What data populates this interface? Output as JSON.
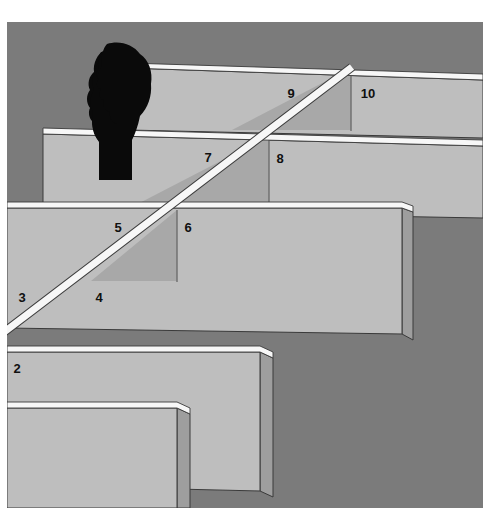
{
  "image": {
    "title": "Maze of walls in perspective with numbered compartments",
    "kind": "grayscale-illustration",
    "width": 483,
    "height": 528,
    "margins": {
      "top": 22,
      "left": 7,
      "right": 0,
      "bottom": 20
    }
  },
  "colors": {
    "background_gray": "#7b7b7b",
    "wall_face_light": "#bebebe",
    "wall_face_shaded": "#a8a8a8",
    "wall_top_highlight": "#f7f7f7",
    "wall_edge_dark": "#8d8d8d",
    "outline": "#3a3a3a",
    "silhouette": "#0a0a0a",
    "page_white": "#ffffff",
    "number_text": "#101010"
  },
  "labels": [
    {
      "id": "2",
      "text": "2",
      "x": 17,
      "y": 368
    },
    {
      "id": "3",
      "text": "3",
      "x": 22,
      "y": 297
    },
    {
      "id": "4",
      "text": "4",
      "x": 99,
      "y": 297
    },
    {
      "id": "5",
      "text": "5",
      "x": 118,
      "y": 227
    },
    {
      "id": "6",
      "text": "6",
      "x": 188,
      "y": 227
    },
    {
      "id": "7",
      "text": "7",
      "x": 208,
      "y": 156
    },
    {
      "id": "8",
      "text": "8",
      "x": 280,
      "y": 157
    },
    {
      "id": "9",
      "text": "9",
      "x": 291,
      "y": 93
    },
    {
      "id": "10",
      "text": "10",
      "x": 366,
      "y": 93
    }
  ],
  "silhouette": {
    "name": "head-profile-silhouette",
    "description": "black profile of a human head with bushy hair, facing right",
    "center_x": 121,
    "center_y": 175
  },
  "diagonal_path": {
    "name": "white-diagonal-path-line",
    "from_x": 0,
    "from_y": 330,
    "to_x": 351,
    "to_y": 66,
    "stroke": "#f7f7f7",
    "width": 7
  },
  "walls": [
    {
      "id": "wall-top",
      "row": 1,
      "label_regions": [
        "9",
        "10"
      ]
    },
    {
      "id": "wall-second",
      "row": 2,
      "label_regions": [
        "7",
        "8"
      ]
    },
    {
      "id": "wall-third",
      "row": 3,
      "label_regions": [
        "5",
        "6"
      ]
    },
    {
      "id": "wall-fourth",
      "row": 4,
      "label_regions": [
        "3",
        "4"
      ]
    },
    {
      "id": "wall-fifth",
      "row": 5,
      "label_regions": [
        "2"
      ]
    },
    {
      "id": "wall-bottom-front",
      "row": 6,
      "label_regions": []
    }
  ]
}
